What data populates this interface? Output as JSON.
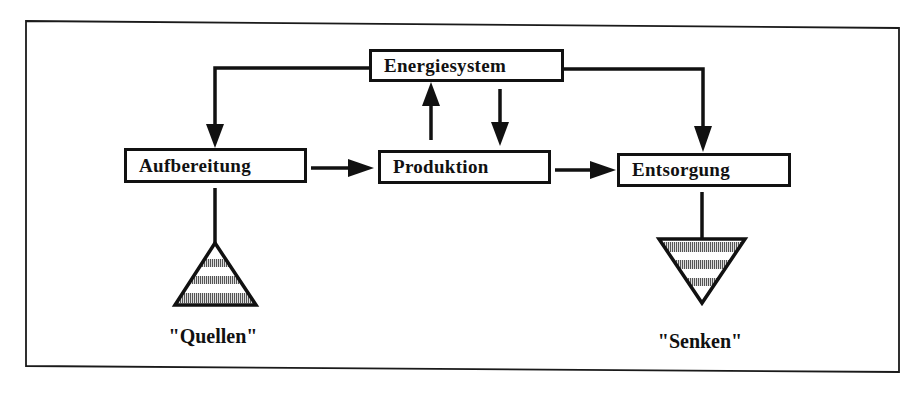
{
  "diagram": {
    "nodes": {
      "energiesystem": {
        "label": "Energiesystem"
      },
      "aufbereitung": {
        "label": "Aufbereitung"
      },
      "produktion": {
        "label": "Produktion"
      },
      "entsorgung": {
        "label": "Entsorgung"
      }
    },
    "terminals": {
      "quellen": {
        "label": "\"Quellen\"",
        "shape": "triangle-up-hatched"
      },
      "senken": {
        "label": "\"Senken\"",
        "shape": "triangle-down-hatched"
      }
    },
    "edges": [
      {
        "from": "Energiesystem",
        "to": "Aufbereitung",
        "type": "arrow"
      },
      {
        "from": "Energiesystem",
        "to": "Entsorgung",
        "type": "arrow"
      },
      {
        "from": "Produktion",
        "to": "Energiesystem",
        "type": "arrow"
      },
      {
        "from": "Energiesystem",
        "to": "Produktion",
        "type": "arrow"
      },
      {
        "from": "Aufbereitung",
        "to": "Produktion",
        "type": "arrow"
      },
      {
        "from": "Produktion",
        "to": "Entsorgung",
        "type": "arrow"
      },
      {
        "from": "Quellen",
        "to": "Aufbereitung",
        "type": "line"
      },
      {
        "from": "Entsorgung",
        "to": "Senken",
        "type": "line"
      }
    ]
  }
}
